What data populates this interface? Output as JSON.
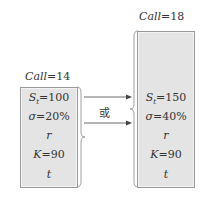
{
  "left": {
    "title_var": "Call",
    "title_val": "=14",
    "rows": [
      {
        "var": "S",
        "sub": "t",
        "val": "=100"
      },
      {
        "var": "σ",
        "sub": "",
        "val": "=20%"
      },
      {
        "var": "r",
        "sub": "",
        "val": ""
      },
      {
        "var": "K",
        "sub": "",
        "val": "=90"
      },
      {
        "var": "t",
        "sub": "",
        "val": ""
      }
    ]
  },
  "right": {
    "title_var": "Call",
    "title_val": "=18",
    "rows": [
      {
        "var": "S",
        "sub": "t",
        "val": "=150"
      },
      {
        "var": "σ",
        "sub": "",
        "val": "=40%"
      },
      {
        "var": "r",
        "sub": "",
        "val": ""
      },
      {
        "var": "K",
        "sub": "",
        "val": "=90"
      },
      {
        "var": "t",
        "sub": "",
        "val": ""
      }
    ]
  },
  "connector_label": "或",
  "colors": {
    "box_fill": "#e4e4e4",
    "box_border": "#9a9a9a",
    "text": "#333333"
  }
}
